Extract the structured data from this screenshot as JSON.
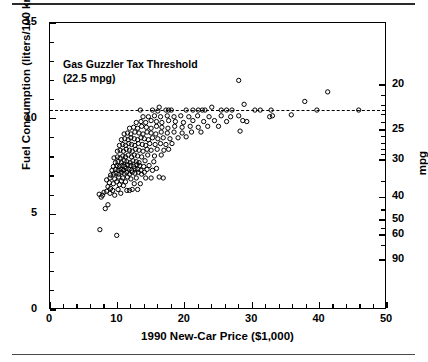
{
  "figure": {
    "top_rule": true,
    "bottom_rule": true,
    "background": "#ffffff",
    "ink": "#000000"
  },
  "annotation": {
    "line1": "Gas Guzzler Tax Threshold",
    "line2": "(22.5 mpg)"
  },
  "chart_data": {
    "type": "scatter",
    "title": "",
    "xlabel": "1990 New-Car Price ($1,000)",
    "ylabel": "Fuel Consumption (liters/100 km)",
    "y2label": "mpg",
    "xlim": [
      0,
      50
    ],
    "ylim": [
      0,
      15
    ],
    "xticks": [
      0,
      10,
      20,
      30,
      40,
      50
    ],
    "xticklabels": [
      "0",
      "10",
      "20",
      "30",
      "40",
      "50"
    ],
    "x_minor_step": 2,
    "yticks": [
      0,
      5,
      10,
      15
    ],
    "yticklabels": [
      "0",
      "5",
      "10",
      "15"
    ],
    "y_minor_step": 1,
    "y2_ticks_mpg": [
      20,
      25,
      30,
      40,
      50,
      60,
      90
    ],
    "y2_ticklabels": [
      "20",
      "25",
      "30",
      "40",
      "50",
      "60",
      "90"
    ],
    "grid": false,
    "legend": "none",
    "marker": "open-circle",
    "marker_size_px": 4.3,
    "threshold": {
      "label": "Gas Guzzler Tax Threshold",
      "sublabel": "(22.5 mpg)",
      "mpg": 22.5,
      "y_value": 10.45,
      "style": "dashed"
    },
    "points": [
      [
        7.4,
        4.2
      ],
      [
        9.9,
        3.9
      ],
      [
        8.2,
        5.3
      ],
      [
        8.6,
        5.5
      ],
      [
        7.6,
        5.9
      ],
      [
        7.8,
        6.0
      ],
      [
        7.3,
        6.05
      ],
      [
        8.0,
        6.15
      ],
      [
        8.4,
        6.2
      ],
      [
        8.9,
        6.1
      ],
      [
        9.3,
        6.25
      ],
      [
        9.6,
        6.0
      ],
      [
        10.1,
        6.3
      ],
      [
        10.5,
        6.1
      ],
      [
        9.0,
        6.35
      ],
      [
        8.6,
        6.45
      ],
      [
        11.4,
        6.25
      ],
      [
        11.8,
        6.25
      ],
      [
        12.2,
        6.3
      ],
      [
        13.0,
        6.3
      ],
      [
        10.9,
        6.5
      ],
      [
        10.3,
        6.55
      ],
      [
        9.4,
        6.6
      ],
      [
        8.8,
        6.65
      ],
      [
        9.9,
        6.7
      ],
      [
        10.6,
        6.75
      ],
      [
        11.2,
        6.7
      ],
      [
        12.5,
        6.6
      ],
      [
        13.4,
        6.6
      ],
      [
        8.4,
        6.8
      ],
      [
        8.9,
        6.9
      ],
      [
        9.6,
        6.85
      ],
      [
        10.2,
        6.95
      ],
      [
        10.8,
        6.9
      ],
      [
        11.5,
        6.95
      ],
      [
        12.0,
        6.85
      ],
      [
        12.8,
        6.9
      ],
      [
        14.2,
        6.9
      ],
      [
        15.0,
        6.9
      ],
      [
        16.2,
        6.95
      ],
      [
        16.8,
        6.9
      ],
      [
        9.0,
        7.05
      ],
      [
        9.4,
        7.1
      ],
      [
        9.8,
        7.15
      ],
      [
        10.2,
        7.1
      ],
      [
        10.6,
        7.2
      ],
      [
        11.0,
        7.15
      ],
      [
        11.4,
        7.2
      ],
      [
        11.8,
        7.1
      ],
      [
        12.2,
        7.2
      ],
      [
        12.6,
        7.15
      ],
      [
        13.1,
        7.2
      ],
      [
        13.6,
        7.1
      ],
      [
        14.0,
        7.2
      ],
      [
        9.2,
        7.3
      ],
      [
        9.7,
        7.35
      ],
      [
        10.1,
        7.3
      ],
      [
        10.5,
        7.35
      ],
      [
        10.9,
        7.3
      ],
      [
        11.3,
        7.4
      ],
      [
        11.7,
        7.35
      ],
      [
        12.1,
        7.3
      ],
      [
        12.6,
        7.4
      ],
      [
        13.0,
        7.35
      ],
      [
        13.5,
        7.3
      ],
      [
        14.4,
        7.35
      ],
      [
        15.2,
        7.3
      ],
      [
        15.8,
        7.4
      ],
      [
        9.4,
        7.5
      ],
      [
        9.9,
        7.55
      ],
      [
        10.3,
        7.5
      ],
      [
        10.7,
        7.55
      ],
      [
        11.1,
        7.5
      ],
      [
        11.5,
        7.6
      ],
      [
        12.0,
        7.55
      ],
      [
        12.4,
        7.5
      ],
      [
        12.9,
        7.6
      ],
      [
        13.3,
        7.55
      ],
      [
        13.9,
        7.5
      ],
      [
        14.7,
        7.55
      ],
      [
        9.7,
        7.7
      ],
      [
        10.1,
        7.75
      ],
      [
        10.6,
        7.7
      ],
      [
        11.0,
        7.8
      ],
      [
        11.4,
        7.75
      ],
      [
        11.9,
        7.7
      ],
      [
        12.3,
        7.8
      ],
      [
        12.8,
        7.75
      ],
      [
        13.2,
        7.7
      ],
      [
        14.1,
        7.8
      ],
      [
        15.4,
        7.75
      ],
      [
        9.5,
        7.95
      ],
      [
        10.0,
        8.0
      ],
      [
        10.4,
        7.95
      ],
      [
        10.8,
        8.05
      ],
      [
        11.2,
        8.0
      ],
      [
        11.6,
        8.1
      ],
      [
        12.1,
        8.0
      ],
      [
        12.5,
        8.1
      ],
      [
        13.0,
        8.05
      ],
      [
        13.6,
        8.0
      ],
      [
        14.5,
        8.1
      ],
      [
        15.5,
        8.05
      ],
      [
        16.5,
        8.1
      ],
      [
        10.0,
        8.3
      ],
      [
        10.4,
        8.35
      ],
      [
        10.9,
        8.3
      ],
      [
        11.3,
        8.4
      ],
      [
        11.8,
        8.35
      ],
      [
        12.2,
        8.3
      ],
      [
        12.7,
        8.4
      ],
      [
        13.2,
        8.35
      ],
      [
        13.8,
        8.3
      ],
      [
        14.4,
        8.4
      ],
      [
        15.0,
        8.35
      ],
      [
        15.9,
        8.4
      ],
      [
        16.9,
        8.35
      ],
      [
        17.6,
        8.4
      ],
      [
        10.3,
        8.6
      ],
      [
        10.8,
        8.65
      ],
      [
        11.2,
        8.6
      ],
      [
        11.7,
        8.7
      ],
      [
        12.1,
        8.65
      ],
      [
        12.6,
        8.6
      ],
      [
        13.1,
        8.7
      ],
      [
        13.7,
        8.65
      ],
      [
        14.2,
        8.6
      ],
      [
        14.8,
        8.7
      ],
      [
        15.6,
        8.65
      ],
      [
        16.4,
        8.7
      ],
      [
        17.2,
        8.65
      ],
      [
        18.1,
        8.7
      ],
      [
        10.6,
        8.9
      ],
      [
        11.1,
        8.95
      ],
      [
        11.6,
        8.9
      ],
      [
        12.0,
        9.0
      ],
      [
        12.5,
        8.95
      ],
      [
        13.0,
        8.9
      ],
      [
        13.5,
        9.0
      ],
      [
        14.0,
        8.95
      ],
      [
        14.6,
        8.9
      ],
      [
        15.2,
        9.0
      ],
      [
        16.0,
        8.95
      ],
      [
        16.8,
        9.0
      ],
      [
        17.8,
        8.95
      ],
      [
        19.0,
        9.0
      ],
      [
        20.2,
        9.05
      ],
      [
        11.0,
        9.2
      ],
      [
        11.5,
        9.25
      ],
      [
        12.0,
        9.2
      ],
      [
        12.6,
        9.3
      ],
      [
        13.2,
        9.25
      ],
      [
        13.8,
        9.2
      ],
      [
        14.4,
        9.3
      ],
      [
        15.0,
        9.25
      ],
      [
        15.7,
        9.2
      ],
      [
        16.5,
        9.3
      ],
      [
        17.4,
        9.25
      ],
      [
        18.4,
        9.3
      ],
      [
        19.6,
        9.25
      ],
      [
        21.0,
        9.3
      ],
      [
        22.4,
        9.3
      ],
      [
        28.2,
        9.35
      ],
      [
        11.8,
        9.5
      ],
      [
        12.4,
        9.55
      ],
      [
        13.0,
        9.5
      ],
      [
        13.6,
        9.6
      ],
      [
        14.3,
        9.55
      ],
      [
        15.0,
        9.5
      ],
      [
        15.8,
        9.6
      ],
      [
        16.6,
        9.55
      ],
      [
        17.5,
        9.5
      ],
      [
        18.5,
        9.6
      ],
      [
        19.6,
        9.55
      ],
      [
        20.8,
        9.6
      ],
      [
        22.0,
        9.55
      ],
      [
        23.4,
        9.6
      ],
      [
        25.0,
        9.6
      ],
      [
        12.8,
        9.8
      ],
      [
        13.5,
        9.85
      ],
      [
        14.2,
        9.8
      ],
      [
        15.0,
        9.9
      ],
      [
        15.8,
        9.85
      ],
      [
        16.6,
        9.8
      ],
      [
        17.6,
        9.9
      ],
      [
        18.6,
        9.85
      ],
      [
        19.8,
        9.8
      ],
      [
        21.2,
        9.9
      ],
      [
        22.8,
        9.85
      ],
      [
        24.4,
        9.9
      ],
      [
        26.2,
        9.85
      ],
      [
        28.6,
        9.9
      ],
      [
        29.2,
        9.85
      ],
      [
        13.8,
        10.1
      ],
      [
        14.6,
        10.1
      ],
      [
        15.5,
        10.15
      ],
      [
        16.4,
        10.1
      ],
      [
        17.4,
        10.15
      ],
      [
        18.4,
        10.1
      ],
      [
        19.4,
        10.15
      ],
      [
        20.6,
        10.1
      ],
      [
        21.9,
        10.15
      ],
      [
        23.6,
        10.1
      ],
      [
        25.4,
        10.15
      ],
      [
        26.8,
        10.1
      ],
      [
        28.0,
        10.15
      ],
      [
        32.6,
        10.1
      ],
      [
        33.0,
        10.15
      ],
      [
        35.8,
        10.2
      ],
      [
        13.4,
        10.45
      ],
      [
        15.2,
        10.45
      ],
      [
        16.0,
        10.4
      ],
      [
        17.2,
        10.45
      ],
      [
        17.6,
        10.45
      ],
      [
        18.0,
        10.45
      ],
      [
        20.2,
        10.45
      ],
      [
        21.2,
        10.45
      ],
      [
        22.0,
        10.45
      ],
      [
        22.6,
        10.45
      ],
      [
        23.0,
        10.45
      ],
      [
        25.4,
        10.45
      ],
      [
        26.2,
        10.45
      ],
      [
        27.0,
        10.45
      ],
      [
        30.4,
        10.45
      ],
      [
        31.2,
        10.45
      ],
      [
        32.8,
        10.45
      ],
      [
        39.6,
        10.45
      ],
      [
        45.8,
        10.45
      ],
      [
        16.2,
        10.6
      ],
      [
        24.0,
        10.6
      ],
      [
        28.8,
        10.75
      ],
      [
        37.8,
        10.9
      ],
      [
        41.2,
        11.4
      ],
      [
        28.0,
        12.0
      ]
    ]
  }
}
